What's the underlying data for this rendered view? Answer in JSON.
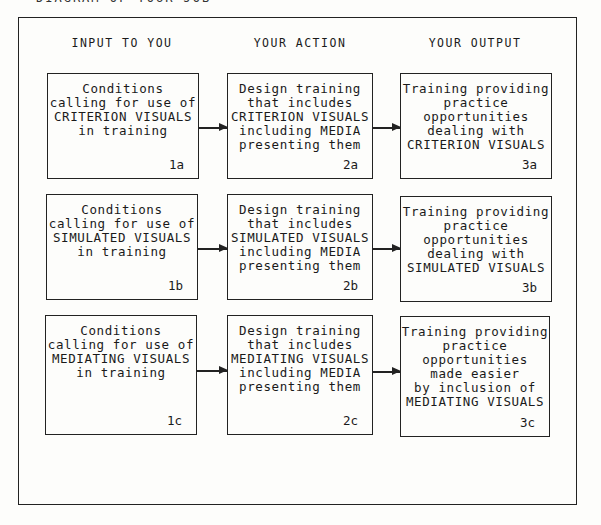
{
  "title": "DIAGRAM OF YOUR JOB",
  "columns": [
    {
      "label": "INPUT TO YOU"
    },
    {
      "label": "YOUR ACTION"
    },
    {
      "label": "YOUR OUTPUT"
    }
  ],
  "rows": [
    {
      "input": {
        "text": "Conditions\ncalling for use of\nCRITERION VISUALS\nin training",
        "id": "1a"
      },
      "action": {
        "text": "Design training\nthat includes\nCRITERION VISUALS\nincluding MEDIA\npresenting them",
        "id": "2a"
      },
      "output": {
        "text": "Training providing\npractice\nopportunities\ndealing with\nCRITERION VISUALS",
        "id": "3a"
      }
    },
    {
      "input": {
        "text": "Conditions\ncalling for use of\nSIMULATED VISUALS\nin training",
        "id": "1b"
      },
      "action": {
        "text": "Design training\nthat includes\nSIMULATED VISUALS\nincluding MEDIA\npresenting them",
        "id": "2b"
      },
      "output": {
        "text": "Training providing\npractice\nopportunities\ndealing with\nSIMULATED VISUALS",
        "id": "3b"
      }
    },
    {
      "input": {
        "text": "Conditions\ncalling for use of\nMEDIATING VISUALS\nin training",
        "id": "1c"
      },
      "action": {
        "text": "Design training\nthat includes\nMEDIATING VISUALS\nincluding MEDIA\npresenting them",
        "id": "2c"
      },
      "output": {
        "text": "Training providing\npractice\nopportunities\nmade easier\nby inclusion of\nMEDIATING VISUALS",
        "id": "3c"
      }
    }
  ]
}
